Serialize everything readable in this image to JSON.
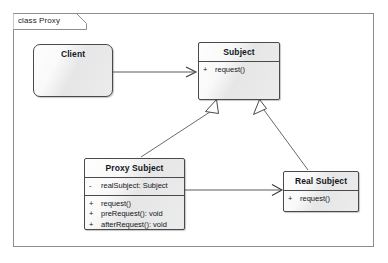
{
  "frame": {
    "label": "class Proxy"
  },
  "classes": [
    {
      "id": "client",
      "name": "Client",
      "attributes": [],
      "operations": []
    },
    {
      "id": "subject",
      "name": "Subject",
      "attributes": [],
      "operations": [
        {
          "visibility": "+",
          "text": "request()"
        }
      ]
    },
    {
      "id": "proxysubject",
      "name": "Proxy Subject",
      "attributes": [
        {
          "visibility": "-",
          "text": "realSubject: Subject"
        }
      ],
      "operations": [
        {
          "visibility": "+",
          "text": "request()"
        },
        {
          "visibility": "+",
          "text": "preRequest(): void"
        },
        {
          "visibility": "+",
          "text": "afterRequest(): void"
        }
      ]
    },
    {
      "id": "realsubject",
      "name": "Real Subject",
      "attributes": [],
      "operations": [
        {
          "visibility": "+",
          "text": "request()"
        }
      ]
    }
  ],
  "relationships": [
    {
      "id": "client-subject",
      "type": "association",
      "from": "Client",
      "to": "Subject",
      "arrow": "open"
    },
    {
      "id": "proxy-subject",
      "type": "generalization",
      "from": "Proxy Subject",
      "to": "Subject",
      "arrow": "hollow-triangle"
    },
    {
      "id": "real-subject",
      "type": "generalization",
      "from": "Real Subject",
      "to": "Subject",
      "arrow": "hollow-triangle"
    },
    {
      "id": "proxy-realsubject",
      "type": "association",
      "from": "Proxy Subject",
      "to": "Real Subject",
      "arrow": "open"
    }
  ],
  "colors": {
    "frame_border": "#8d8d8d",
    "class_border": "#4a4a4a",
    "class_fill": "#e9e9e9",
    "line": "#5a5a5a",
    "text": "#12161c",
    "background": "#ffffff"
  }
}
